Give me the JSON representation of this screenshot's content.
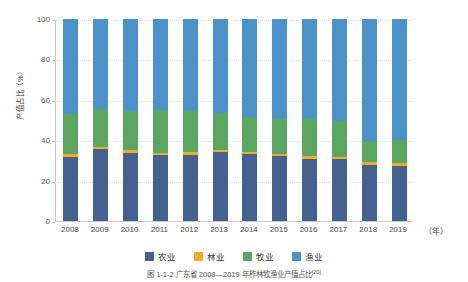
{
  "chart_data": {
    "type": "bar",
    "subtype": "stacked-percentage-column",
    "title": "",
    "xlabel": "（年）",
    "ylabel": "产值占比（%）",
    "ylim": [
      0,
      100
    ],
    "yticks": [
      0,
      20,
      40,
      60,
      80,
      100
    ],
    "ytick_labels": [
      "0",
      "20",
      "40",
      "60",
      "80",
      "100"
    ],
    "grid": "horizontal-dotted",
    "legend_position": "bottom-center",
    "categories": [
      "2008",
      "2009",
      "2010",
      "2011",
      "2012",
      "2013",
      "2014",
      "2015",
      "2016",
      "2017",
      "2018",
      "2019"
    ],
    "series": [
      {
        "name": "农业",
        "color": "#44618f",
        "values": [
          31.7,
          35.6,
          33.7,
          32.7,
          32.8,
          34.2,
          33.2,
          32.2,
          30.7,
          30.7,
          27.7,
          27.2
        ]
      },
      {
        "name": "林业",
        "color": "#f0ab2b",
        "values": [
          1.3,
          1.0,
          1.3,
          1.2,
          1.3,
          1.0,
          1.1,
          1.2,
          1.3,
          1.0,
          1.3,
          1.3
        ]
      },
      {
        "name": "牧业",
        "color": "#5aa55f",
        "values": [
          20.0,
          18.7,
          19.5,
          21.1,
          20.2,
          18.5,
          17.2,
          17.1,
          18.5,
          17.8,
          10.5,
          11.5
        ]
      },
      {
        "name": "渔业",
        "color": "#4b92c9",
        "values": [
          47.0,
          44.7,
          45.5,
          45.0,
          45.7,
          46.3,
          48.5,
          49.5,
          49.5,
          50.5,
          60.5,
          60.0
        ]
      }
    ],
    "legend": [
      {
        "label": "农业",
        "color": "#44618f"
      },
      {
        "label": "林业",
        "color": "#f0ab2b"
      },
      {
        "label": "牧业",
        "color": "#5aa55f"
      },
      {
        "label": "渔业",
        "color": "#4b92c9"
      }
    ],
    "caption": "图 1-1-2  广东省 2008—2019 年柞林牧渔业产值占比",
    "caption_superscript": "[20]"
  }
}
